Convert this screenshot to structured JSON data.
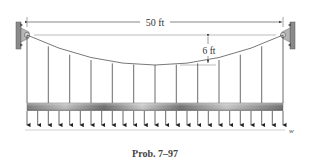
{
  "figure": {
    "caption": "Prob. 7–97",
    "span_label": "50 ft",
    "sag_label": "6 ft",
    "load_label": "w"
  },
  "colors": {
    "line": "#555555",
    "support": "#8a8a8a",
    "deck_dark": "#6e6e6e",
    "deck_light": "#c8c8c8",
    "text": "#333333"
  },
  "structure": {
    "span_ft": 50,
    "sag_ft": 6,
    "hanger_count": 13,
    "load_arrow_count": 25
  }
}
